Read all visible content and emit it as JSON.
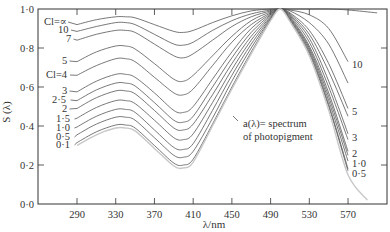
{
  "chart_data": {
    "type": "line",
    "title": "",
    "xlabel": "λ/nm",
    "ylabel": "S (λ)",
    "xlim": [
      250,
      610
    ],
    "ylim": [
      0.0,
      1.0
    ],
    "grid": false,
    "x_ticks": [
      290,
      330,
      370,
      410,
      450,
      490,
      530,
      570
    ],
    "x_tick_labels": [
      "290",
      "330",
      "370",
      "410",
      "450",
      "490",
      "530",
      "570"
    ],
    "y_ticks": [
      0.0,
      0.2,
      0.4,
      0.6,
      0.8,
      1.0
    ],
    "y_tick_labels": [
      "0·0",
      "0·2",
      "0·4",
      "0·6",
      "0·8",
      "1·0"
    ],
    "x": [
      290,
      310,
      330,
      340,
      350,
      370,
      390,
      400,
      410,
      430,
      450,
      470,
      490,
      500,
      510,
      530,
      550,
      570
    ],
    "series": [
      {
        "name": "Cl=∞",
        "values": [
          0.92,
          0.945,
          0.96,
          0.96,
          0.955,
          0.92,
          0.885,
          0.88,
          0.89,
          0.93,
          0.965,
          0.99,
          1.0,
          1.0,
          1.0,
          1.0,
          1.0,
          1.0
        ]
      },
      {
        "name": "10",
        "values": [
          0.885,
          0.91,
          0.93,
          0.93,
          0.92,
          0.87,
          0.82,
          0.815,
          0.83,
          0.89,
          0.94,
          0.975,
          0.995,
          1.0,
          0.995,
          0.97,
          0.9,
          0.73
        ]
      },
      {
        "name": "7",
        "values": [
          0.84,
          0.87,
          0.89,
          0.89,
          0.88,
          0.82,
          0.76,
          0.75,
          0.77,
          0.84,
          0.91,
          0.96,
          0.99,
          1.0,
          0.99,
          0.93,
          0.82,
          0.62
        ]
      },
      {
        "name": "5",
        "values": [
          0.73,
          0.78,
          0.81,
          0.81,
          0.795,
          0.72,
          0.64,
          0.63,
          0.66,
          0.76,
          0.86,
          0.94,
          0.985,
          1.0,
          0.98,
          0.89,
          0.72,
          0.49
        ]
      },
      {
        "name": "Cl=4",
        "values": [
          0.66,
          0.71,
          0.745,
          0.745,
          0.73,
          0.65,
          0.57,
          0.56,
          0.59,
          0.71,
          0.83,
          0.92,
          0.98,
          1.0,
          0.975,
          0.87,
          0.68,
          0.45
        ]
      },
      {
        "name": "3",
        "values": [
          0.575,
          0.63,
          0.665,
          0.665,
          0.65,
          0.57,
          0.48,
          0.47,
          0.5,
          0.64,
          0.78,
          0.9,
          0.975,
          1.0,
          0.97,
          0.85,
          0.63,
          0.36
        ]
      },
      {
        "name": "2·5",
        "values": [
          0.53,
          0.585,
          0.62,
          0.62,
          0.605,
          0.52,
          0.43,
          0.42,
          0.45,
          0.6,
          0.75,
          0.88,
          0.97,
          1.0,
          0.965,
          0.83,
          0.6,
          0.33
        ]
      },
      {
        "name": "2",
        "values": [
          0.49,
          0.545,
          0.58,
          0.58,
          0.565,
          0.48,
          0.39,
          0.38,
          0.41,
          0.56,
          0.72,
          0.86,
          0.965,
          1.0,
          0.96,
          0.81,
          0.57,
          0.27
        ]
      },
      {
        "name": "1·5",
        "values": [
          0.44,
          0.495,
          0.53,
          0.53,
          0.515,
          0.43,
          0.34,
          0.33,
          0.36,
          0.52,
          0.69,
          0.84,
          0.96,
          1.0,
          0.955,
          0.8,
          0.55,
          0.25
        ]
      },
      {
        "name": "1·0",
        "values": [
          0.395,
          0.45,
          0.485,
          0.485,
          0.47,
          0.38,
          0.29,
          0.28,
          0.31,
          0.48,
          0.66,
          0.82,
          0.955,
          1.0,
          0.95,
          0.79,
          0.53,
          0.22
        ]
      },
      {
        "name": "0·5",
        "values": [
          0.355,
          0.41,
          0.445,
          0.445,
          0.43,
          0.34,
          0.25,
          0.24,
          0.27,
          0.44,
          0.63,
          0.8,
          0.95,
          1.0,
          0.945,
          0.78,
          0.51,
          0.18
        ]
      },
      {
        "name": "0·1",
        "values": [
          0.315,
          0.37,
          0.405,
          0.405,
          0.39,
          0.3,
          0.21,
          0.2,
          0.23,
          0.41,
          0.6,
          0.78,
          0.945,
          1.0,
          0.94,
          0.77,
          0.5,
          0.17
        ]
      },
      {
        "name": "a(λ) = spectrum of photopigment",
        "values": [
          0.3,
          0.355,
          0.39,
          0.39,
          0.375,
          0.285,
          0.195,
          0.185,
          0.215,
          0.4,
          0.59,
          0.77,
          0.94,
          1.0,
          0.935,
          0.76,
          0.48,
          0.15
        ]
      }
    ],
    "left_curve_labels": [
      "Cl=∝",
      "10",
      "7",
      "5",
      "Cl=4",
      "3",
      "2·5",
      "2",
      "1·5",
      "1·0",
      "0·5",
      "0·1"
    ],
    "right_curve_labels": [
      "10",
      "5",
      "3",
      "2",
      "1·0",
      "0·5"
    ],
    "annotation": {
      "line1": "a(λ)= spectrum",
      "line2": "of photopigment"
    }
  },
  "style": {
    "line_color": "#555555",
    "pigment_line_color": "#c8c8c8",
    "axis_color": "#333333"
  }
}
